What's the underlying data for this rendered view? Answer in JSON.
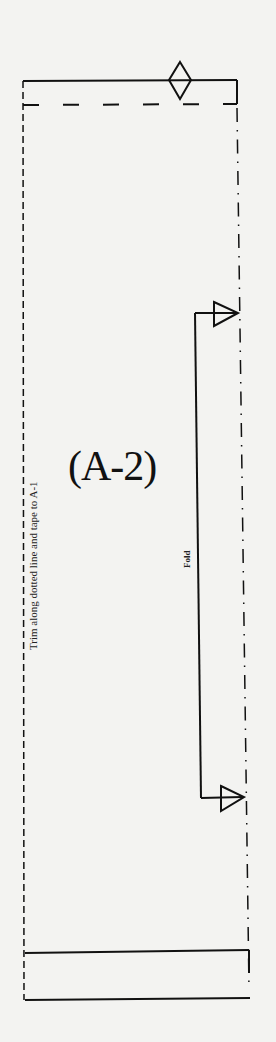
{
  "pattern": {
    "piece_label": "(A-2)",
    "fold_label": "Fold",
    "trim_instruction": "Trim along dotted line and tape to A-1"
  },
  "colors": {
    "paper": "#f3f3f1",
    "line": "#111111"
  }
}
